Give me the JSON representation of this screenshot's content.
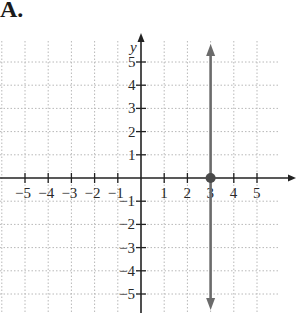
{
  "figure_label": "A.",
  "chart_data": {
    "type": "line",
    "title": "",
    "xlabel": "x",
    "ylabel": "y",
    "xlim": [
      -6,
      6
    ],
    "ylim": [
      -6,
      6
    ],
    "x_ticks": [
      -5,
      -4,
      -3,
      -2,
      -1,
      1,
      2,
      3,
      4,
      5
    ],
    "y_ticks": [
      -5,
      -4,
      -3,
      -2,
      -1,
      1,
      2,
      3,
      4,
      5
    ],
    "grid": true,
    "series": [
      {
        "name": "x = 3",
        "kind": "vertical line with arrows at both ends",
        "x": [
          3,
          3
        ],
        "y": [
          -5.6,
          5.6
        ],
        "color": "#6b6b6b"
      }
    ],
    "points": [
      {
        "x": 3,
        "y": 0,
        "style": "filled dot",
        "color": "#4a4a4a"
      }
    ]
  },
  "colors": {
    "axis": "#222222",
    "grid": "#b8b8b8",
    "line": "#6b6b6b",
    "point": "#444444"
  }
}
